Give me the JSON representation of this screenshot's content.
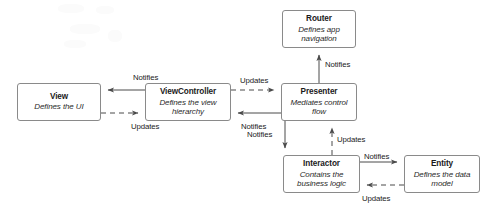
{
  "diagram": {
    "background_color": "#ffffff",
    "stroke_color": "#4a4a4a",
    "box_border_color": "#8a8a8a",
    "text_color": "#1b1b1b",
    "nodes": [
      {
        "id": "view",
        "title": "View",
        "subtitle": "Defines the UI",
        "x": 17,
        "y": 83,
        "w": 84,
        "h": 38
      },
      {
        "id": "viewcontroller",
        "title": "ViewController",
        "subtitle": "Defines the view hierarchy",
        "x": 145,
        "y": 83,
        "w": 86,
        "h": 38
      },
      {
        "id": "presenter",
        "title": "Presenter",
        "subtitle": "Mediates control flow",
        "x": 281,
        "y": 83,
        "w": 76,
        "h": 38
      },
      {
        "id": "router",
        "title": "Router",
        "subtitle": "Defines app navigation",
        "x": 282,
        "y": 10,
        "w": 74,
        "h": 38
      },
      {
        "id": "interactor",
        "title": "Interactor",
        "subtitle": "Contains the business logic",
        "x": 283,
        "y": 155,
        "w": 77,
        "h": 38
      },
      {
        "id": "entity",
        "title": "Entity",
        "subtitle": "Defines the data model",
        "x": 404,
        "y": 155,
        "w": 76,
        "h": 38
      }
    ],
    "edges": [
      {
        "id": "vc-to-view-notifies",
        "label": "Notifies",
        "from": "viewcontroller",
        "to": "view",
        "style": "solid",
        "label_x": 133,
        "label_y": 73
      },
      {
        "id": "view-to-vc-updates",
        "label": "Updates",
        "from": "view",
        "to": "viewcontroller",
        "style": "dashed",
        "label_x": 131,
        "label_y": 122
      },
      {
        "id": "vc-to-presenter-updates",
        "label": "Updates",
        "from": "viewcontroller",
        "to": "presenter",
        "style": "dashed",
        "label_x": 240,
        "label_y": 76
      },
      {
        "id": "presenter-to-vc-notifies",
        "label": "Notifies",
        "from": "presenter",
        "to": "viewcontroller",
        "style": "solid",
        "label_x": 241,
        "label_y": 122
      },
      {
        "id": "presenter-to-router-notifies",
        "label": "Notifies",
        "from": "presenter",
        "to": "router",
        "style": "solid",
        "label_x": 325,
        "label_y": 60
      },
      {
        "id": "presenter-to-interactor-notifies",
        "label": "Notifies",
        "from": "presenter",
        "to": "interactor",
        "style": "solid",
        "label_x": 247,
        "label_y": 130
      },
      {
        "id": "interactor-to-presenter-updates",
        "label": "Updates",
        "from": "interactor",
        "to": "presenter",
        "style": "dashed",
        "label_x": 337,
        "label_y": 135
      },
      {
        "id": "interactor-to-entity-notifies",
        "label": "Notifies",
        "from": "interactor",
        "to": "entity",
        "style": "solid",
        "label_x": 364,
        "label_y": 152
      },
      {
        "id": "entity-to-interactor-updates",
        "label": "Updates",
        "from": "entity",
        "to": "interactor",
        "style": "dashed",
        "label_x": 362,
        "label_y": 194
      }
    ]
  }
}
